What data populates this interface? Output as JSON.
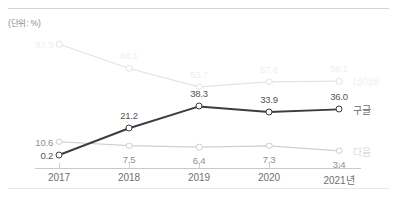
{
  "unit_note": "(단위: %)",
  "chart_data": {
    "type": "line",
    "title": "",
    "subtitle": "",
    "xlabel": "",
    "ylabel": "",
    "unit": "(단위: %)",
    "grid": false,
    "legend_position": "right-inline",
    "categories": [
      "2017",
      "2018",
      "2019",
      "2020",
      "2021년"
    ],
    "x_tick_labels": [
      "2017",
      "2018",
      "2019",
      "2020",
      "2021년"
    ],
    "ylim": [
      0,
      95
    ],
    "series": [
      {
        "name": "네이버",
        "color": "#e3e3e3",
        "label_color": "#efefef",
        "name_color": "#f1f1f1",
        "values": [
          87.3,
          68.1,
          53.7,
          57.6,
          58.1
        ],
        "value_labels": [
          "87.3",
          "68.1",
          "53.7",
          "57.6",
          "58.1"
        ]
      },
      {
        "name": "구글",
        "color": "#3d3d3d",
        "label_color": "#555555",
        "name_color": "#6b6b6b",
        "values": [
          0.2,
          21.2,
          38.3,
          33.9,
          36.0
        ],
        "value_labels": [
          "0.2",
          "21.2",
          "38.3",
          "33.9",
          "36.0"
        ]
      },
      {
        "name": "다음",
        "color": "#cfcfcf",
        "label_color": "#8f8f8f",
        "name_color": "#dcdcdc",
        "values": [
          10.6,
          7.5,
          6.4,
          7.3,
          3.4
        ],
        "value_labels": [
          "10.6",
          "7.5",
          "6.4",
          "7.3",
          "3.4"
        ]
      }
    ]
  }
}
